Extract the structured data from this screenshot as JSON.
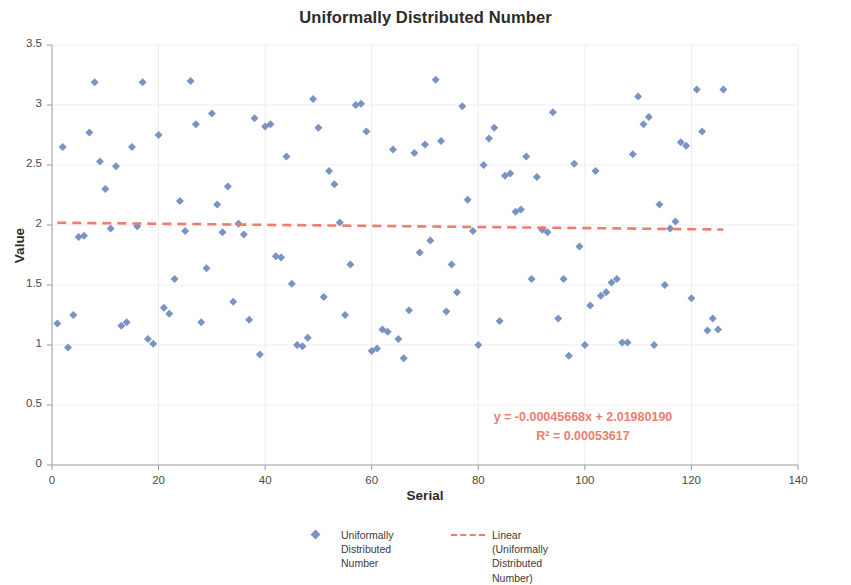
{
  "chart_data": {
    "type": "scatter",
    "title": "Uniformally Distributed Number",
    "xlabel": "Serial",
    "ylabel": "Value",
    "xlim": [
      0,
      140
    ],
    "ylim": [
      0,
      3.5
    ],
    "xticks": [
      "0",
      "20",
      "40",
      "60",
      "80",
      "100",
      "120",
      "140"
    ],
    "yticks": [
      "0",
      "0.5",
      "1",
      "1.5",
      "2",
      "2.5",
      "3",
      "3.5"
    ],
    "xtick_values": [
      0,
      20,
      40,
      60,
      80,
      100,
      120,
      140
    ],
    "ytick_values": [
      0,
      0.5,
      1,
      1.5,
      2,
      2.5,
      3,
      3.5
    ],
    "grid": true,
    "grid_color": "#EDEDED",
    "legend_position": "bottom",
    "marker_color": "#7A92C4",
    "marker_shape": "diamond",
    "trendline_color": "#ED7D6E",
    "trendline_style": "dashed",
    "series": [
      {
        "name": "Uniformally Distributed Number",
        "type": "scatter",
        "points": [
          [
            1,
            1.18
          ],
          [
            2,
            2.65
          ],
          [
            3,
            0.98
          ],
          [
            4,
            1.25
          ],
          [
            5,
            1.9
          ],
          [
            6,
            1.91
          ],
          [
            7,
            2.77
          ],
          [
            8,
            3.19
          ],
          [
            9,
            2.53
          ],
          [
            10,
            2.3
          ],
          [
            11,
            1.97
          ],
          [
            12,
            2.49
          ],
          [
            13,
            1.16
          ],
          [
            14,
            1.19
          ],
          [
            15,
            2.65
          ],
          [
            16,
            1.99
          ],
          [
            17,
            3.19
          ],
          [
            18,
            1.05
          ],
          [
            19,
            1.01
          ],
          [
            20,
            2.75
          ],
          [
            21,
            1.31
          ],
          [
            22,
            1.26
          ],
          [
            23,
            1.55
          ],
          [
            24,
            2.2
          ],
          [
            25,
            1.95
          ],
          [
            26,
            3.2
          ],
          [
            27,
            2.84
          ],
          [
            28,
            1.19
          ],
          [
            29,
            1.64
          ],
          [
            30,
            2.93
          ],
          [
            31,
            2.17
          ],
          [
            32,
            1.94
          ],
          [
            33,
            2.32
          ],
          [
            34,
            1.36
          ],
          [
            35,
            2.01
          ],
          [
            36,
            1.92
          ],
          [
            37,
            1.21
          ],
          [
            38,
            2.89
          ],
          [
            39,
            0.92
          ],
          [
            40,
            2.82
          ],
          [
            41,
            2.84
          ],
          [
            42,
            1.74
          ],
          [
            43,
            1.73
          ],
          [
            44,
            2.57
          ],
          [
            45,
            1.51
          ],
          [
            46,
            1.0
          ],
          [
            47,
            0.99
          ],
          [
            48,
            1.06
          ],
          [
            49,
            3.05
          ],
          [
            50,
            2.81
          ],
          [
            51,
            1.4
          ],
          [
            52,
            2.45
          ],
          [
            53,
            2.34
          ],
          [
            54,
            2.02
          ],
          [
            55,
            1.25
          ],
          [
            56,
            1.67
          ],
          [
            57,
            3.0
          ],
          [
            58,
            3.01
          ],
          [
            59,
            2.78
          ],
          [
            60,
            0.95
          ],
          [
            61,
            0.97
          ],
          [
            62,
            1.13
          ],
          [
            63,
            1.11
          ],
          [
            64,
            2.63
          ],
          [
            65,
            1.05
          ],
          [
            66,
            0.89
          ],
          [
            67,
            1.29
          ],
          [
            68,
            2.6
          ],
          [
            69,
            1.77
          ],
          [
            70,
            2.67
          ],
          [
            71,
            1.87
          ],
          [
            72,
            3.21
          ],
          [
            73,
            2.7
          ],
          [
            74,
            1.28
          ],
          [
            75,
            1.67
          ],
          [
            76,
            1.44
          ],
          [
            77,
            2.99
          ],
          [
            78,
            2.21
          ],
          [
            79,
            1.95
          ],
          [
            80,
            1.0
          ],
          [
            81,
            2.5
          ],
          [
            82,
            2.72
          ],
          [
            83,
            2.81
          ],
          [
            84,
            1.2
          ],
          [
            85,
            2.41
          ],
          [
            86,
            2.43
          ],
          [
            87,
            2.11
          ],
          [
            88,
            2.13
          ],
          [
            89,
            2.57
          ],
          [
            90,
            1.55
          ],
          [
            91,
            2.4
          ],
          [
            92,
            1.96
          ],
          [
            93,
            1.94
          ],
          [
            94,
            2.94
          ],
          [
            95,
            1.22
          ],
          [
            96,
            1.55
          ],
          [
            97,
            0.91
          ],
          [
            98,
            2.51
          ],
          [
            99,
            1.82
          ],
          [
            100,
            1.0
          ],
          [
            101,
            1.33
          ],
          [
            102,
            2.45
          ],
          [
            103,
            1.41
          ],
          [
            104,
            1.44
          ],
          [
            105,
            1.52
          ],
          [
            106,
            1.55
          ],
          [
            107,
            1.02
          ],
          [
            108,
            1.02
          ],
          [
            109,
            2.59
          ],
          [
            110,
            3.07
          ],
          [
            111,
            2.84
          ],
          [
            112,
            2.9
          ],
          [
            113,
            1.0
          ],
          [
            114,
            2.17
          ],
          [
            115,
            1.5
          ],
          [
            116,
            1.97
          ],
          [
            117,
            2.03
          ],
          [
            118,
            2.69
          ],
          [
            119,
            2.66
          ],
          [
            120,
            1.39
          ],
          [
            121,
            3.13
          ],
          [
            122,
            2.78
          ],
          [
            123,
            1.12
          ],
          [
            124,
            1.22
          ],
          [
            125,
            1.13
          ],
          [
            126,
            3.13
          ]
        ]
      },
      {
        "name": "Linear (Uniformally Distributed Number)",
        "type": "line",
        "equation": "y = -0.00045668x + 2.01980190",
        "r_squared": "R² = 0.00053617",
        "slope": -0.00045668,
        "intercept": 2.0198019,
        "x_start": 1,
        "x_end": 126
      }
    ],
    "annotations": [
      {
        "text": "y = -0.00045668x + 2.01980190"
      },
      {
        "text": "R² = 0.00053617"
      }
    ],
    "legend": [
      {
        "key": "marker",
        "lines": [
          "Uniformally",
          "Distributed",
          "Number"
        ]
      },
      {
        "key": "dashed-line",
        "lines": [
          "Linear (Uniformally",
          "Distributed",
          "Number)"
        ]
      }
    ]
  }
}
